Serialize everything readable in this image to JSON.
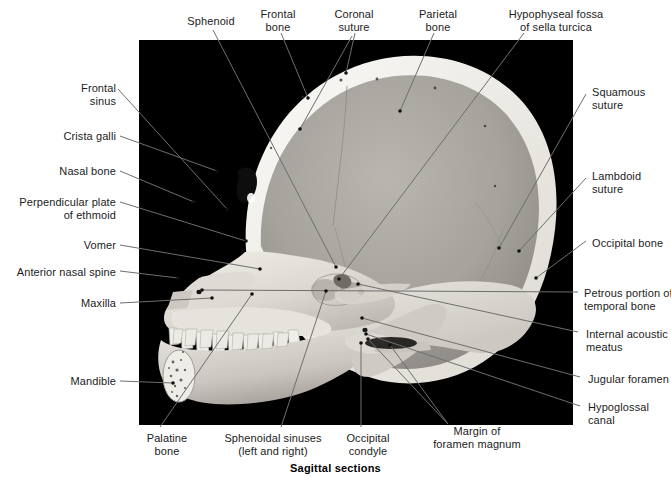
{
  "figure": {
    "caption": "Sagittal sections",
    "photo": {
      "background_color": "#000000",
      "bone_color": "#e8e6e1",
      "shadow_color": "#8f8d88"
    },
    "leader_color": "#6e6e6e",
    "text_color": "#1c1c1c"
  },
  "labels": [
    {
      "id": "sphenoid",
      "lines": [
        "Sphenoid"
      ],
      "align": "center",
      "x": 176,
      "y": 15,
      "w": 70
    },
    {
      "id": "frontal-bone",
      "lines": [
        "Frontal",
        "bone"
      ],
      "align": "center",
      "x": 248,
      "y": 8,
      "w": 60
    },
    {
      "id": "coronal-suture",
      "lines": [
        "Coronal",
        "suture"
      ],
      "align": "center",
      "x": 324,
      "y": 8,
      "w": 60
    },
    {
      "id": "parietal-bone",
      "lines": [
        "Parietal",
        "bone"
      ],
      "align": "center",
      "x": 408,
      "y": 8,
      "w": 60
    },
    {
      "id": "hypophyseal-fossa",
      "lines": [
        "Hypophyseal fossa",
        "of sella turcica"
      ],
      "align": "center",
      "x": 492,
      "y": 8,
      "w": 128
    },
    {
      "id": "frontal-sinus",
      "lines": [
        "Frontal",
        "sinus"
      ],
      "align": "right",
      "x": 40,
      "y": 82,
      "w": 76
    },
    {
      "id": "crista-galli",
      "lines": [
        "Crista galli"
      ],
      "align": "right",
      "x": 34,
      "y": 130,
      "w": 82
    },
    {
      "id": "nasal-bone",
      "lines": [
        "Nasal bone"
      ],
      "align": "right",
      "x": 34,
      "y": 165,
      "w": 82
    },
    {
      "id": "perpendicular-plate",
      "lines": [
        "Perpendicular plate",
        "of ethmoid"
      ],
      "align": "right",
      "x": 8,
      "y": 196,
      "w": 108
    },
    {
      "id": "vomer",
      "lines": [
        "Vomer"
      ],
      "align": "right",
      "x": 50,
      "y": 239,
      "w": 66
    },
    {
      "id": "anterior-nasal-spine",
      "lines": [
        "Anterior nasal spine"
      ],
      "align": "right",
      "x": 8,
      "y": 266,
      "w": 108
    },
    {
      "id": "maxilla",
      "lines": [
        "Maxilla"
      ],
      "align": "right",
      "x": 48,
      "y": 297,
      "w": 68
    },
    {
      "id": "mandible",
      "lines": [
        "Mandible"
      ],
      "align": "right",
      "x": 42,
      "y": 375,
      "w": 74
    },
    {
      "id": "squamous-suture",
      "lines": [
        "Squamous",
        "suture"
      ],
      "align": "left",
      "x": 592,
      "y": 86,
      "w": 76
    },
    {
      "id": "lambdoid-suture",
      "lines": [
        "Lambdoid",
        "suture"
      ],
      "align": "left",
      "x": 592,
      "y": 170,
      "w": 76
    },
    {
      "id": "occipital-bone",
      "lines": [
        "Occipital bone"
      ],
      "align": "left",
      "x": 592,
      "y": 237,
      "w": 80
    },
    {
      "id": "petrous-portion",
      "lines": [
        "Petrous portion of",
        "temporal bone"
      ],
      "align": "left",
      "x": 584,
      "y": 287,
      "w": 88
    },
    {
      "id": "internal-acoustic-meatus",
      "lines": [
        "Internal acoustic",
        "meatus"
      ],
      "align": "left",
      "x": 586,
      "y": 328,
      "w": 84
    },
    {
      "id": "jugular-foramen",
      "lines": [
        "Jugular foramen"
      ],
      "align": "left",
      "x": 588,
      "y": 373,
      "w": 84
    },
    {
      "id": "hypoglossal-canal",
      "lines": [
        "Hypoglossal",
        "canal"
      ],
      "align": "left",
      "x": 588,
      "y": 401,
      "w": 82
    },
    {
      "id": "palatine-bone",
      "lines": [
        "Palatine",
        "bone"
      ],
      "align": "center",
      "x": 131,
      "y": 432,
      "w": 72
    },
    {
      "id": "sphenoidal-sinuses",
      "lines": [
        "Sphenoidal sinuses",
        "(left and right)"
      ],
      "align": "center",
      "x": 212,
      "y": 432,
      "w": 122
    },
    {
      "id": "occipital-condyle",
      "lines": [
        "Occipital",
        "condyle"
      ],
      "align": "center",
      "x": 333,
      "y": 432,
      "w": 70
    },
    {
      "id": "margin-foramen-magnum",
      "lines": [
        "Margin of",
        "foramen magnum"
      ],
      "align": "center",
      "x": 417,
      "y": 425,
      "w": 120
    }
  ],
  "leaders": [
    {
      "id": "sphenoid",
      "pts": [
        [
          213,
          30
        ],
        [
          336,
          267
        ]
      ]
    },
    {
      "id": "frontal-bone",
      "pts": [
        [
          281,
          33
        ],
        [
          308,
          98
        ]
      ]
    },
    {
      "id": "coronal-suture-a",
      "pts": [
        [
          355,
          33
        ],
        [
          346,
          73
        ]
      ]
    },
    {
      "id": "coronal-suture-b",
      "pts": [
        [
          352,
          36
        ],
        [
          300,
          129
        ]
      ]
    },
    {
      "id": "parietal-bone",
      "pts": [
        [
          434,
          33
        ],
        [
          400,
          111
        ]
      ]
    },
    {
      "id": "hypophyseal-fossa",
      "pts": [
        [
          524,
          33
        ],
        [
          339,
          279
        ]
      ]
    },
    {
      "id": "frontal-sinus",
      "pts": [
        [
          118,
          89
        ],
        [
          227,
          209
        ]
      ]
    },
    {
      "id": "crista-galli",
      "pts": [
        [
          120,
          136
        ],
        [
          217,
          171
        ]
      ]
    },
    {
      "id": "nasal-bone",
      "pts": [
        [
          120,
          171
        ],
        [
          194,
          202
        ]
      ]
    },
    {
      "id": "perpendicular-plate",
      "pts": [
        [
          120,
          202
        ],
        [
          246,
          241
        ]
      ]
    },
    {
      "id": "vomer",
      "pts": [
        [
          120,
          245
        ],
        [
          260,
          269
        ]
      ]
    },
    {
      "id": "anterior-nasal-spine",
      "pts": [
        [
          120,
          271
        ],
        [
          178,
          278
        ]
      ]
    },
    {
      "id": "maxilla",
      "pts": [
        [
          120,
          303
        ],
        [
          212,
          298
        ]
      ]
    },
    {
      "id": "mandible",
      "pts": [
        [
          120,
          381
        ],
        [
          173,
          383
        ]
      ]
    },
    {
      "id": "squamous-suture",
      "pts": [
        [
          586,
          94
        ],
        [
          499,
          248
        ]
      ]
    },
    {
      "id": "lambdoid-suture",
      "pts": [
        [
          586,
          178
        ],
        [
          519,
          251
        ]
      ]
    },
    {
      "id": "occipital-bone",
      "pts": [
        [
          586,
          241
        ],
        [
          536,
          278
        ]
      ]
    },
    {
      "id": "petrous-portion",
      "pts": [
        [
          578,
          292
        ],
        [
          202,
          290
        ]
      ]
    },
    {
      "id": "internal-acoustic-meatus",
      "pts": [
        [
          578,
          332
        ],
        [
          358,
          284
        ]
      ]
    },
    {
      "id": "jugular-foramen",
      "pts": [
        [
          580,
          377
        ],
        [
          362,
          318
        ]
      ]
    },
    {
      "id": "hypoglossal-canal",
      "pts": [
        [
          580,
          406
        ],
        [
          366,
          334
        ]
      ]
    },
    {
      "id": "palatine-bone",
      "pts": [
        [
          160,
          427
        ],
        [
          252,
          294
        ]
      ]
    },
    {
      "id": "sphenoidal-sinuses",
      "pts": [
        [
          281,
          427
        ],
        [
          326,
          291
        ]
      ]
    },
    {
      "id": "occipital-condyle",
      "pts": [
        [
          361,
          427
        ],
        [
          361,
          343
        ]
      ]
    },
    {
      "id": "margin-foramen-a",
      "pts": [
        [
          448,
          424
        ],
        [
          368,
          339
        ]
      ]
    },
    {
      "id": "margin-foramen-b",
      "pts": [
        [
          448,
          424
        ],
        [
          390,
          345
        ]
      ]
    }
  ]
}
